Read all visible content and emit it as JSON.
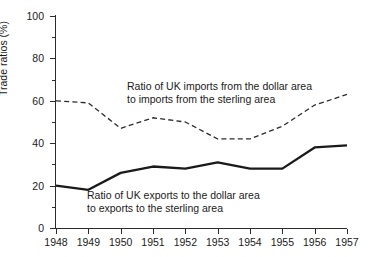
{
  "chart_data": {
    "type": "line",
    "title": "",
    "xlabel": "",
    "ylabel": "Trade ratios (%)",
    "x": [
      1948,
      1949,
      1950,
      1951,
      1952,
      1953,
      1954,
      1955,
      1956,
      1957
    ],
    "xtick_labels": [
      "1948",
      "1949",
      "1950",
      "1951",
      "1952",
      "1953",
      "1954",
      "1955",
      "1956",
      "1957"
    ],
    "ytick_labels": [
      "0",
      "20",
      "40",
      "60",
      "80",
      "100"
    ],
    "ytick_values": [
      0,
      20,
      40,
      60,
      80,
      100
    ],
    "yminor_values": [
      10,
      30,
      50,
      70,
      90
    ],
    "ylim": [
      0,
      100
    ],
    "xlim": [
      1948,
      1957
    ],
    "grid": false,
    "legend": "inline-annotations",
    "series": [
      {
        "name": "Ratio of UK imports from the dollar area to imports from the sterling area",
        "style": "dashed",
        "color": "#2b2b2b",
        "values": [
          60,
          59,
          47,
          52,
          50,
          42,
          42,
          48,
          58,
          63
        ]
      },
      {
        "name": "Ratio of UK exports to the dollar area to exports to the sterling area",
        "style": "solid",
        "color": "#1a1a1a",
        "values": [
          20,
          18,
          26,
          29,
          28,
          31,
          28,
          28,
          38,
          39
        ]
      }
    ],
    "annotations": [
      {
        "id": "imports",
        "line1": "Ratio of UK imports from the dollar area",
        "line2": "to imports from the sterling area"
      },
      {
        "id": "exports",
        "line1": "Ratio of UK exports to the dollar area",
        "line2": "to exports to the sterling area"
      }
    ]
  }
}
